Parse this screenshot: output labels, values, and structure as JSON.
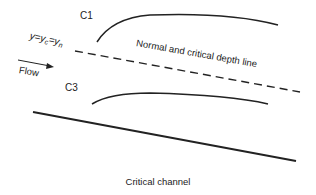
{
  "diagram": {
    "title": "Critical channel",
    "labels": {
      "c1": "C1",
      "c3": "C3",
      "depth_eq_y": "y=y",
      "depth_eq_c": "c",
      "depth_eq_mid": "=y",
      "depth_eq_n": "n",
      "flow": "Flow",
      "depth_line": "Normal and critical depth line"
    },
    "colors": {
      "line": "#222222",
      "text": "#222222"
    }
  }
}
